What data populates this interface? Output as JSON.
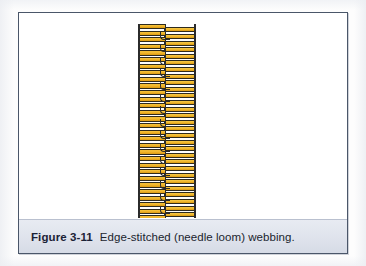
{
  "figure": {
    "number_label": "Figure 3-11",
    "caption": "Edge-stitched (needle loom) webbing.",
    "full_caption": "Figure 3-11  Edge-stitched (needle loom) webbing.",
    "subject": "Edge-stitched (needle loom) webbing"
  },
  "illustration": {
    "name": "edge-stitched-webbing-diagram",
    "description": "Vertical strip of woven webbing shown as stacked horizontal weft bars between dark vertical warp lines, with stitch loops along the centre selvage.",
    "weft_bar_count_left": 30,
    "weft_bar_count_right": 30,
    "warp_line_count": 3,
    "stitch_hook_count": 15,
    "colors": {
      "weft_fill_light": "#f4c13a",
      "weft_fill_mid": "#f0b429",
      "weft_fill_dark": "#d99a14",
      "outline": "#2b2b2b"
    }
  },
  "frame": {
    "border_color": "#4a5669",
    "panel_background": "#ffffff"
  },
  "caption_bar": {
    "background_color": "#dfe3ec",
    "text_color": "#20242e",
    "number_color": "#1b2236"
  }
}
